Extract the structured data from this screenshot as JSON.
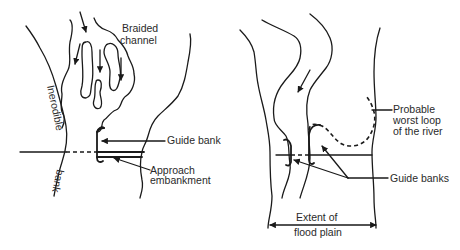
{
  "left_diagram": {
    "labels": {
      "braided_line1": "Braided",
      "braided_line2": "channel",
      "inerodible": "Inerodible",
      "bank": "bank",
      "guide_bank": "Guide bank",
      "approach_line1": "Approach",
      "approach_line2": "embankment"
    }
  },
  "right_diagram": {
    "labels": {
      "probable_line1": "Probable",
      "probable_line2": "worst loop",
      "probable_line3": "of the river",
      "guide_banks": "Guide banks",
      "extent_line1": "Extent of",
      "extent_line2": "flood plain"
    }
  },
  "colors": {
    "ink": "#1a1a1a",
    "background": "#ffffff"
  }
}
